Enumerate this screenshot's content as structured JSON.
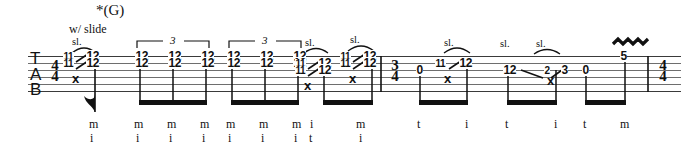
{
  "document": {
    "type": "guitar-tablature",
    "staff_label": [
      "T",
      "A",
      "B"
    ],
    "width": 681,
    "height": 153
  },
  "annotations": {
    "chord_symbol": "*(G)",
    "performance_direction": "w/ slide",
    "slide_mark": "sl.",
    "vibrato_mark": "vibrato-squiggle",
    "tuplet_number": "3"
  },
  "time_signatures": {
    "opening": {
      "top": "4",
      "bottom": "4"
    },
    "middle": {
      "top": "3",
      "bottom": "4"
    },
    "closing": {
      "top": "4",
      "bottom": "4"
    }
  },
  "fingering_labels": {
    "thumb": "t",
    "index": "i",
    "middle": "m"
  },
  "measures": [
    {
      "index": 0,
      "time_signature": "4/4",
      "beats": [
        {
          "id": "b0",
          "x": 80,
          "slide": true,
          "slide_label": "sl.",
          "notes": [
            {
              "string": 1,
              "from": "11",
              "to": "12"
            },
            {
              "string": 2,
              "from": "11",
              "to": "12"
            },
            {
              "string": 4,
              "mute": "x"
            }
          ],
          "fingering": [
            "m",
            "i"
          ],
          "stem": "flag"
        },
        {
          "id": "b1",
          "x": 140,
          "tuplet": "3",
          "notes": [
            {
              "string": 1,
              "fret": "12"
            },
            {
              "string": 2,
              "fret": "12"
            }
          ],
          "fingering": [
            "m",
            "i"
          ]
        },
        {
          "id": "b2",
          "x": 173,
          "notes": [
            {
              "string": 1,
              "fret": "12"
            },
            {
              "string": 2,
              "fret": "12"
            }
          ],
          "fingering": [
            "m",
            "i"
          ]
        },
        {
          "id": "b3",
          "x": 206,
          "notes": [
            {
              "string": 1,
              "fret": "12"
            },
            {
              "string": 2,
              "fret": "12"
            }
          ],
          "fingering": [
            "m",
            "i"
          ]
        },
        {
          "id": "b4",
          "x": 232,
          "tuplet": "3",
          "notes": [
            {
              "string": 1,
              "fret": "12"
            },
            {
              "string": 2,
              "fret": "12"
            }
          ],
          "fingering": [
            "m",
            "i"
          ]
        },
        {
          "id": "b5",
          "x": 265,
          "notes": [
            {
              "string": 1,
              "fret": "12"
            },
            {
              "string": 2,
              "fret": "12"
            }
          ],
          "fingering": [
            "m",
            "i"
          ]
        },
        {
          "id": "b6",
          "x": 293,
          "notes": [
            {
              "string": 1,
              "fret": "12"
            },
            {
              "string": 2,
              "fret": "12"
            }
          ],
          "fingering": [
            "m",
            "i"
          ]
        },
        {
          "id": "b7",
          "x": 310,
          "slide": true,
          "slide_label": "sl.",
          "notes": [
            {
              "string": 2,
              "from": "11",
              "to": "12"
            },
            {
              "string": 3,
              "from": "11",
              "to": "12"
            },
            {
              "string": 5,
              "mute": "x"
            }
          ],
          "fingering": [
            "i",
            "t"
          ]
        },
        {
          "id": "b8",
          "x": 352,
          "slide": true,
          "slide_label": "sl.",
          "notes": [
            {
              "string": 1,
              "from": "11",
              "to": "12"
            },
            {
              "string": 2,
              "from": "11",
              "to": "12"
            },
            {
              "string": 4,
              "mute": "x"
            }
          ],
          "fingering": [
            "m",
            "i"
          ]
        }
      ]
    },
    {
      "index": 1,
      "time_signature": "3/4",
      "beats": [
        {
          "id": "b9",
          "x": 419,
          "notes": [
            {
              "string": 3,
              "fret": "0"
            }
          ],
          "fingering": [
            "t"
          ]
        },
        {
          "id": "b10",
          "x": 452,
          "slide": true,
          "slide_label": "sl.",
          "notes": [
            {
              "string": 2,
              "from": "11",
              "to": "12"
            },
            {
              "string": 4,
              "mute": "x"
            }
          ],
          "fingering": [
            "i"
          ]
        },
        {
          "id": "b11",
          "x": 508,
          "notes": [
            {
              "string": 3,
              "fret": "12"
            }
          ],
          "fingering": [
            "t"
          ]
        },
        {
          "id": "b12",
          "x": 548,
          "slide": true,
          "slide_label": "sl.",
          "notes": [
            {
              "string": 3,
              "from": "2",
              "to": "3"
            },
            {
              "string": 4,
              "mute": "x"
            }
          ],
          "fingering": [
            "i"
          ]
        },
        {
          "id": "b13",
          "x": 585,
          "notes": [
            {
              "string": 3,
              "fret": "0"
            }
          ],
          "fingering": [
            "t"
          ]
        },
        {
          "id": "b14",
          "x": 623,
          "vibrato": true,
          "notes": [
            {
              "string": 1,
              "fret": "5"
            }
          ],
          "fingering": [
            "m"
          ]
        }
      ]
    }
  ]
}
